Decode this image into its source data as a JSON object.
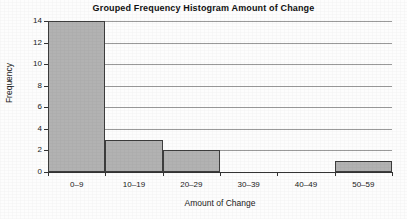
{
  "chart_data": {
    "type": "bar",
    "title": "Grouped Frequency Histogram Amount of Change",
    "xlabel": "Amount of Change",
    "ylabel": "Frequency",
    "categories": [
      "0–9",
      "10–19",
      "20–29",
      "30–39",
      "40–49",
      "50–59"
    ],
    "values": [
      14,
      3,
      2,
      0,
      0,
      1
    ],
    "ylim": [
      0,
      14
    ],
    "yticks": [
      0,
      2,
      4,
      6,
      8,
      10,
      12,
      14
    ],
    "ytick_labels": [
      "0",
      "2",
      "4",
      "6",
      "8",
      "10",
      "12",
      "14"
    ],
    "grid": true,
    "legend": "none",
    "bar_fill_color": "#b2b2b2",
    "bar_edge_color": "#3d3d3d",
    "gridline_color": "#9a9a9a",
    "axis_color": "#333333"
  }
}
